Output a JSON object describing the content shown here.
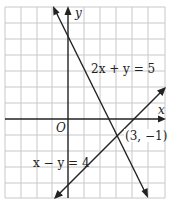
{
  "figure": {
    "axes": {
      "x_label": "x",
      "y_label": "y",
      "origin_label": "O"
    },
    "grid": {
      "x_min": -4,
      "x_max": 6,
      "y_min": -5,
      "y_max": 7,
      "unit_px": 16
    },
    "lines": [
      {
        "equation": "2x + y = 5",
        "label": "2x + y = 5"
      },
      {
        "equation": "x − y = 4",
        "label": "x − y = 4"
      }
    ],
    "intersection": {
      "x": 3,
      "y": -1,
      "label": "(3, −1)"
    }
  }
}
